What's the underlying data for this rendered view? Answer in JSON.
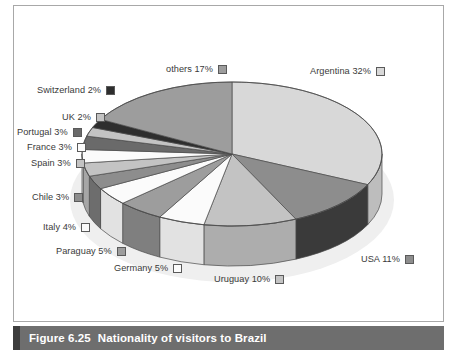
{
  "caption": {
    "figure_number": "Figure 6.25",
    "title": "Nationality of visitors to Brazil"
  },
  "chart_data": {
    "type": "pie",
    "title": "Nationality of visitors to Brazil",
    "xlabel": "",
    "ylabel": "",
    "unit": "%",
    "three_d": true,
    "legend_position": "around-slices",
    "grid": false,
    "categories": [
      "Argentina",
      "USA",
      "Uruguay",
      "Germany",
      "Paraguay",
      "Italy",
      "Chile",
      "Spain",
      "France",
      "Portugal",
      "UK",
      "Switzerland",
      "others"
    ],
    "values": [
      32,
      11,
      10,
      5,
      5,
      4,
      3,
      3,
      3,
      3,
      2,
      2,
      17
    ],
    "slices": [
      {
        "label": "Argentina 32%",
        "name": "Argentina",
        "value": 32,
        "color": "#d8d8d8",
        "side_color": "#bdbdbd"
      },
      {
        "label": "USA 11%",
        "name": "USA",
        "value": 11,
        "color": "#8d8d8d",
        "side_color": "#3a3a3a"
      },
      {
        "label": "Uruguay 10%",
        "name": "Uruguay",
        "value": 10,
        "color": "#c3c3c3",
        "side_color": "#adadad"
      },
      {
        "label": "Germany 5%",
        "name": "Germany",
        "value": 5,
        "color": "#fbfbfb",
        "side_color": "#e2e2e2"
      },
      {
        "label": "Paraguay 5%",
        "name": "Paraguay",
        "value": 5,
        "color": "#9d9d9d",
        "side_color": "#7f7f7f"
      },
      {
        "label": "Italy 4%",
        "name": "Italy",
        "value": 4,
        "color": "#fbfbfb",
        "side_color": "#e2e2e2"
      },
      {
        "label": "Chile 3%",
        "name": "Chile",
        "value": 3,
        "color": "#8d8d8d",
        "side_color": "#6d6d6d"
      },
      {
        "label": "Spain 3%",
        "name": "Spain",
        "value": 3,
        "color": "#c3c3c3",
        "side_color": "#a6a6a6"
      },
      {
        "label": "France 3%",
        "name": "France",
        "value": 3,
        "color": "#fbfbfb",
        "side_color": "#e2e2e2"
      },
      {
        "label": "Portugal 3%",
        "name": "Portugal",
        "value": 3,
        "color": "#6a6a6a",
        "side_color": "#4a4a4a"
      },
      {
        "label": "UK 2%",
        "name": "UK",
        "value": 2,
        "color": "#c3c3c3",
        "side_color": "#a6a6a6"
      },
      {
        "label": "Switzerland 2%",
        "name": "Switzerland",
        "value": 2,
        "color": "#2e2e2e",
        "side_color": "#1c1c1c"
      },
      {
        "label": "others 17%",
        "name": "others",
        "value": 17,
        "color": "#9d9d9d",
        "side_color": "#7f7f7f"
      }
    ]
  },
  "labels": [
    {
      "key": "argentina",
      "text": "Argentina 32%",
      "swatch": "#d8d8d8"
    },
    {
      "key": "others",
      "text": "others 17%",
      "swatch": "#9d9d9d"
    },
    {
      "key": "switzerland",
      "text": "Switzerland 2%",
      "swatch": "#2e2e2e"
    },
    {
      "key": "uk",
      "text": "UK 2%",
      "swatch": "#c3c3c3"
    },
    {
      "key": "portugal",
      "text": "Portugal 3%",
      "swatch": "#6a6a6a"
    },
    {
      "key": "france",
      "text": "France 3%",
      "swatch": "#fbfbfb"
    },
    {
      "key": "spain",
      "text": "Spain 3%",
      "swatch": "#c3c3c3"
    },
    {
      "key": "chile",
      "text": "Chile 3%",
      "swatch": "#8d8d8d"
    },
    {
      "key": "italy",
      "text": "Italy 4%",
      "swatch": "#fbfbfb"
    },
    {
      "key": "paraguay",
      "text": "Paraguay 5%",
      "swatch": "#9d9d9d"
    },
    {
      "key": "germany",
      "text": "Germany 5%",
      "swatch": "#fbfbfb"
    },
    {
      "key": "uruguay",
      "text": "Uruguay 10%",
      "swatch": "#c3c3c3"
    },
    {
      "key": "usa",
      "text": "USA 11%",
      "swatch": "#8d8d8d"
    }
  ],
  "colors": {
    "frame_border": "#a8a8a8",
    "caption_bg": "#6e6e6e",
    "caption_accent": "#3d3d3d",
    "caption_text": "#ffffff",
    "label_text": "#3a3a3a",
    "page_bg": "#ffffff"
  }
}
